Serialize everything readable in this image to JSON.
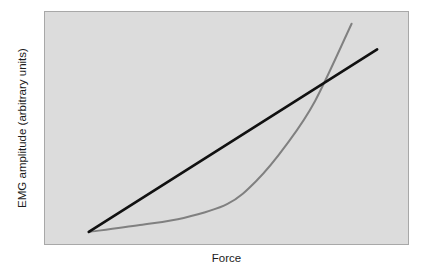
{
  "chart_data": {
    "type": "line",
    "title": "",
    "subtitle": "",
    "xlabel": "Force",
    "ylabel": "EMG amplitude (arbitrary units)",
    "grid": false,
    "legend": "none",
    "xlim": [
      0,
      100
    ],
    "ylim": [
      0,
      100
    ],
    "xticks": [],
    "yticks": [],
    "xticklabels": [],
    "yticklabels": [],
    "annotations": [],
    "series": [
      {
        "name": "linear relationship",
        "style": "straight-line",
        "color": "#111111",
        "linewidth": 2.6,
        "x": [
          12,
          91
        ],
        "y": [
          6,
          84
        ]
      },
      {
        "name": "curvilinear relationship",
        "style": "curve",
        "color": "#808080",
        "linewidth": 2.0,
        "x": [
          12,
          26,
          38,
          50,
          58,
          66,
          74,
          84
        ],
        "y": [
          6,
          9,
          12,
          18,
          28,
          43,
          62,
          95
        ]
      }
    ],
    "crossing_point": {
      "x": 67,
      "y": 55
    }
  },
  "figure": {
    "background_color": "#ffffff",
    "plot_background_color": "#dcdcdc",
    "plot_border_color": "#a8a8a8",
    "axis_label_color": "#1c1c1c"
  }
}
